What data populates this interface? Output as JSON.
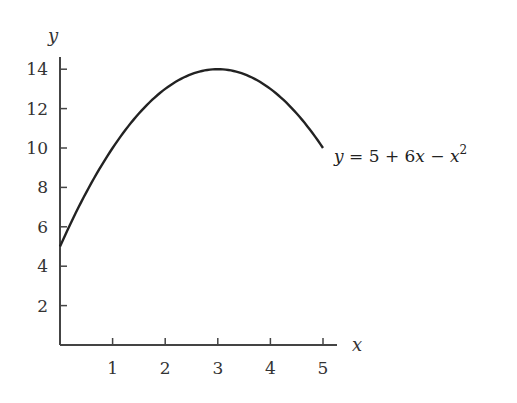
{
  "chart_data": {
    "type": "line",
    "title": "",
    "xlabel": "x",
    "ylabel": "y",
    "xlim": [
      0,
      5.3
    ],
    "ylim": [
      0,
      14.8
    ],
    "x_ticks": [
      1,
      2,
      3,
      4,
      5
    ],
    "y_ticks": [
      2,
      4,
      6,
      8,
      10,
      12,
      14
    ],
    "grid": false,
    "series": [
      {
        "name": "y = 5 + 6x - x^2",
        "function": "5 + 6x - x^2",
        "x": [
          0,
          0.5,
          1,
          1.5,
          2,
          2.5,
          3,
          3.5,
          4,
          4.5,
          5
        ],
        "values": [
          5,
          7.75,
          10,
          11.75,
          13,
          13.75,
          14,
          13.75,
          13,
          11.75,
          10
        ]
      }
    ],
    "annotations": [
      {
        "text": "y = 5 + 6x − x²",
        "x": 5,
        "y": 10,
        "position": "right of curve end"
      }
    ]
  },
  "labels": {
    "x_axis": "x",
    "y_axis": "y",
    "equation_y": "y",
    "equation_eq": " = 5 + 6",
    "equation_x1": "x",
    "equation_minus": " − ",
    "equation_x2": "x",
    "equation_exp": "2"
  }
}
